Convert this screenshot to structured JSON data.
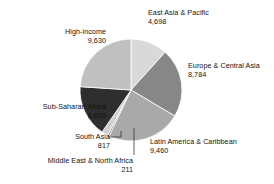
{
  "chart_data": {
    "type": "pie",
    "title": "",
    "subtitle": "",
    "xlabel": "",
    "ylabel": "",
    "legend_position": "none",
    "grid": false,
    "total": 40205,
    "start_angle_deg": 0,
    "direction": "clockwise",
    "categories": [
      "East Asia & Pacific",
      "Europe & Central Asia",
      "Latin America & Caribbean",
      "Middle East & North Africa",
      "South Asia",
      "Sub-Saharan Africa",
      "High-income"
    ],
    "values": [
      4698,
      8784,
      9460,
      211,
      817,
      6605,
      9630
    ],
    "slices": [
      {
        "name": "east-asia-pacific",
        "label": "East Asia & Pacific",
        "value_label": "4,698",
        "value": 4698,
        "color": "#d9d9d9"
      },
      {
        "name": "europe-central-asia",
        "label": "Europe & Central Asia",
        "value_label": "8,784",
        "value": 8784,
        "color": "#878787"
      },
      {
        "name": "latin-america-caribbean",
        "label": "Latin America & Caribbean",
        "value_label": "9,460",
        "value": 9460,
        "color": "#a9a9a9"
      },
      {
        "name": "middle-east-north-africa",
        "label": "Middle East & North Africa",
        "value_label": "211",
        "value": 211,
        "color": "#6f6f6f"
      },
      {
        "name": "south-asia",
        "label": "South Asia",
        "value_label": "817",
        "value": 817,
        "color": "#cfcfcf"
      },
      {
        "name": "sub-saharan-africa",
        "label": "Sub-Saharan Africa",
        "value_label": "6,605",
        "value": 6605,
        "color": "#2e2e2e"
      },
      {
        "name": "high-income",
        "label": "High-income",
        "value_label": "9,630",
        "value": 9630,
        "color": "#c0c0c0"
      }
    ],
    "geometry": {
      "center_x": 131,
      "center_y": 90,
      "radius": 51,
      "slice_border_color": "#ffffff",
      "slice_border_width": 0.8
    },
    "leader_lines": {
      "south_asia_color": "#333333",
      "middle_east_color": "#333333"
    },
    "background_color": "#ffffff"
  }
}
